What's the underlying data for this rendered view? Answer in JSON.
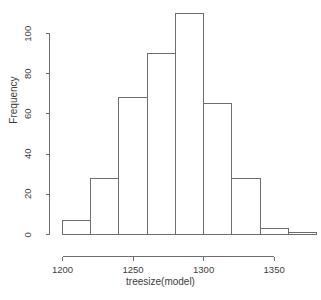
{
  "chart_data": {
    "type": "bar",
    "subtype": "histogram",
    "title": "",
    "xlabel": "treesize(model)",
    "ylabel": "Frequency",
    "bin_width": 20,
    "bin_edges": [
      1200,
      1220,
      1240,
      1260,
      1280,
      1300,
      1320,
      1340,
      1360,
      1380
    ],
    "categories": [
      "1200-1220",
      "1220-1240",
      "1240-1260",
      "1260-1280",
      "1280-1300",
      "1300-1320",
      "1320-1340",
      "1340-1360",
      "1360-1380"
    ],
    "values": [
      7,
      28,
      68,
      90,
      110,
      65,
      28,
      3,
      1
    ],
    "x_ticks": [
      1200,
      1250,
      1300,
      1350
    ],
    "x_tick_labels": [
      "1200",
      "1250",
      "1300",
      "1350"
    ],
    "y_ticks": [
      0,
      20,
      40,
      60,
      80,
      100
    ],
    "y_tick_labels": [
      "0",
      "20",
      "40",
      "60",
      "80",
      "100"
    ],
    "xlim": [
      1200,
      1380
    ],
    "ylim": [
      0,
      110
    ],
    "grid": false,
    "legend": null,
    "bar_fill": "#ffffff",
    "bar_stroke": "#6d6d6d",
    "background": "#ffffff",
    "axis_color": "#6d6d6d",
    "text_color": "#3d3d3d"
  }
}
